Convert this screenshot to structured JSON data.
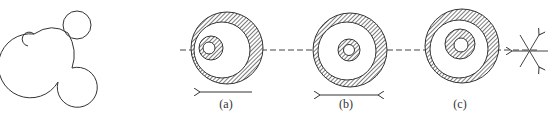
{
  "figure": {
    "panels": [
      {
        "id": "left",
        "label": "",
        "description": "cluster of overlapping circles / bubble outline"
      },
      {
        "id": "a",
        "label": "(a)",
        "description": "eccentric inner shaded annulus offset to the left, arrow pointing left"
      },
      {
        "id": "b",
        "label": "(b)",
        "description": "concentric inner shaded annulus, double-headed arrow"
      },
      {
        "id": "c",
        "label": "(c)",
        "description": "inner shaded annulus offset up-left, no axis"
      },
      {
        "id": "star",
        "label": "",
        "description": "six-direction star with arrows"
      }
    ],
    "colors": {
      "stroke": "#333333",
      "hatch": "#555555",
      "background": "#ffffff"
    }
  }
}
